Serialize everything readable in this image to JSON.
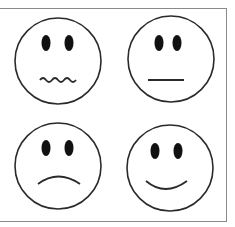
{
  "figure": {
    "stroke_color": "#2a2a2a",
    "frame_color": "#8a8a8a",
    "faces": [
      {
        "position": "top-left",
        "expression": "wavy-mouth",
        "icon": "anxious-face-icon"
      },
      {
        "position": "top-right",
        "expression": "straight-mouth",
        "icon": "neutral-face-icon"
      },
      {
        "position": "bottom-left",
        "expression": "frown",
        "icon": "sad-face-icon"
      },
      {
        "position": "bottom-right",
        "expression": "smile",
        "icon": "happy-face-icon"
      }
    ]
  }
}
